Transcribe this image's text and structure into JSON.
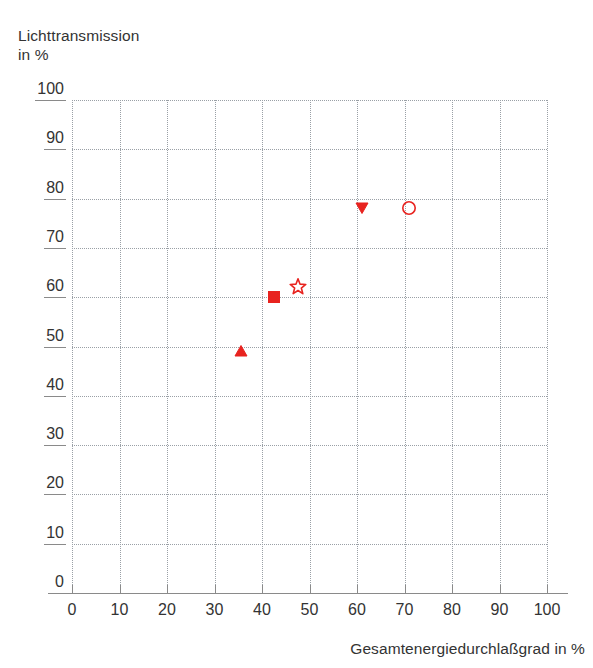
{
  "chart_data": {
    "type": "scatter",
    "title": "",
    "xlabel": "Gesamtenergiedurchlaßgrad in %",
    "ylabel": "Lichttransmission\nin %",
    "xlim": [
      0,
      100
    ],
    "ylim": [
      0,
      100
    ],
    "grid": true,
    "legend": "none",
    "xticks": [
      "0",
      "10",
      "20",
      "30",
      "40",
      "50",
      "60",
      "70",
      "80",
      "90",
      "100"
    ],
    "yticks": [
      "0",
      "10",
      "20",
      "30",
      "40",
      "50",
      "60",
      "70",
      "80",
      "90",
      "100"
    ],
    "xtick_values": [
      0,
      10,
      20,
      30,
      40,
      50,
      60,
      70,
      80,
      90,
      100
    ],
    "ytick_values": [
      0,
      10,
      20,
      30,
      40,
      50,
      60,
      70,
      80,
      90,
      100
    ],
    "marker_color": "#e8231f",
    "points": [
      {
        "name": "triangle-up-point",
        "marker": "triangle-up",
        "fill": "solid",
        "x": 35.5,
        "y": 49.0
      },
      {
        "name": "square-point",
        "marker": "square",
        "fill": "solid",
        "x": 42.5,
        "y": 60.0
      },
      {
        "name": "star-point",
        "marker": "star",
        "fill": "open",
        "x": 47.5,
        "y": 62.0
      },
      {
        "name": "triangle-down-point",
        "marker": "triangle-down",
        "fill": "solid",
        "x": 61.0,
        "y": 78.0
      },
      {
        "name": "circle-point",
        "marker": "circle",
        "fill": "open",
        "x": 71.0,
        "y": 78.0
      }
    ]
  },
  "axes": {
    "y_title": "Lichttransmission\nin %",
    "x_title": "Gesamtenergiedurchlaßgrad in %"
  },
  "colors": {
    "marker": "#e8231f",
    "grid": "#9aa0a6",
    "axis": "#8a8a8a",
    "text": "#333333",
    "background": "#ffffff"
  }
}
